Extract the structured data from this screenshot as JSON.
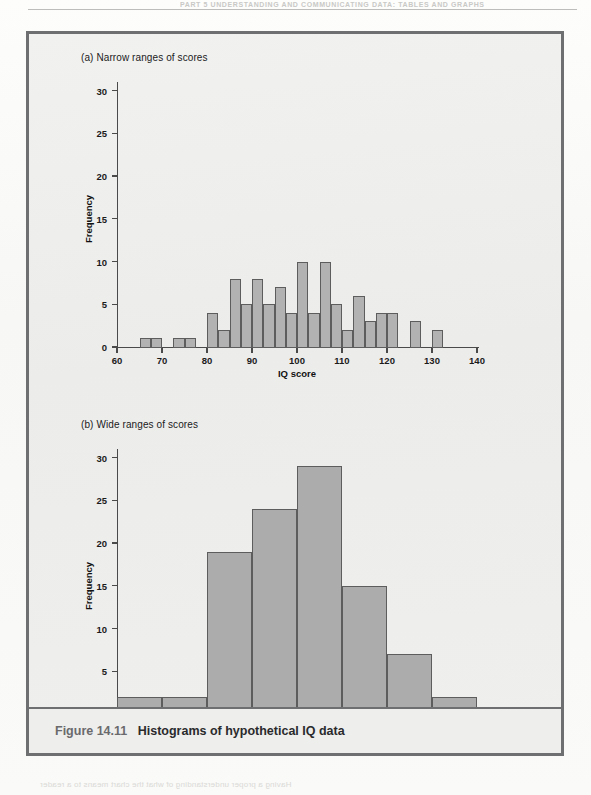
{
  "page": {
    "running_head": "PART 5  UNDERSTANDING AND COMMUNICATING DATA: TABLES AND GRAPHS",
    "ghost_texts": [
      {
        "text": "Figure 14.12  The weary physician: an illustrated tale",
        "x": 150,
        "y": 368,
        "size": 8.5
      },
      {
        "text": "Figure 14.13  Comparison of histogram and bar chart",
        "x": 140,
        "y": 588,
        "size": 8.5
      },
      {
        "text": "the value but does not appear in the category axis because no space",
        "x": 60,
        "y": 650,
        "size": 8
      },
      {
        "text": "the bars and the relative size of a comparison, are still kept in the",
        "x": 60,
        "y": 663,
        "size": 8
      },
      {
        "text": "which data are drawn. A histogram is a plot of a frequency dist",
        "x": 60,
        "y": 676,
        "size": 8
      },
      {
        "text": "Barplots",
        "x": 420,
        "y": 712,
        "size": 11
      },
      {
        "text": "Having a proper understanding of what the chart means to a reader",
        "x": 40,
        "y": 780,
        "size": 8
      }
    ]
  },
  "figure": {
    "caption_label": "Figure 14.11",
    "caption_title": "Histograms of hypothetical IQ data"
  },
  "panels": [
    {
      "id": "panel-a",
      "title": "(a) Narrow ranges of scores"
    },
    {
      "id": "panel-b",
      "title": "(b) Wide ranges of scores"
    }
  ],
  "chart_data": [
    {
      "type": "bar",
      "id": "histogram-narrow",
      "title": "(a) Narrow ranges of scores",
      "xlabel": "IQ score",
      "ylabel": "Frequency",
      "xlim": [
        60,
        140
      ],
      "ylim": [
        0,
        31
      ],
      "xticks": [
        60,
        70,
        80,
        90,
        100,
        110,
        120,
        130,
        140
      ],
      "yticks": [
        0,
        5,
        10,
        15,
        20,
        25,
        30
      ],
      "grid": false,
      "legend": "none",
      "bin_width": 2.5,
      "bars": [
        {
          "x0": 65,
          "x1": 67.5,
          "value": 1
        },
        {
          "x0": 67.5,
          "x1": 70,
          "value": 1
        },
        {
          "x0": 72.5,
          "x1": 75,
          "value": 1
        },
        {
          "x0": 75,
          "x1": 77.5,
          "value": 1
        },
        {
          "x0": 80,
          "x1": 82.5,
          "value": 4
        },
        {
          "x0": 82.5,
          "x1": 85,
          "value": 2
        },
        {
          "x0": 85,
          "x1": 87.5,
          "value": 8
        },
        {
          "x0": 87.5,
          "x1": 90,
          "value": 5
        },
        {
          "x0": 90,
          "x1": 92.5,
          "value": 8
        },
        {
          "x0": 92.5,
          "x1": 95,
          "value": 5
        },
        {
          "x0": 95,
          "x1": 97.5,
          "value": 7
        },
        {
          "x0": 97.5,
          "x1": 100,
          "value": 4
        },
        {
          "x0": 100,
          "x1": 102.5,
          "value": 10
        },
        {
          "x0": 102.5,
          "x1": 105,
          "value": 4
        },
        {
          "x0": 105,
          "x1": 107.5,
          "value": 10
        },
        {
          "x0": 107.5,
          "x1": 110,
          "value": 5
        },
        {
          "x0": 110,
          "x1": 112.5,
          "value": 2
        },
        {
          "x0": 112.5,
          "x1": 115,
          "value": 6
        },
        {
          "x0": 115,
          "x1": 117.5,
          "value": 3
        },
        {
          "x0": 117.5,
          "x1": 120,
          "value": 4
        },
        {
          "x0": 120,
          "x1": 122.5,
          "value": 4
        },
        {
          "x0": 125,
          "x1": 127.5,
          "value": 3
        },
        {
          "x0": 130,
          "x1": 132.5,
          "value": 2
        }
      ]
    },
    {
      "type": "bar",
      "id": "histogram-wide",
      "title": "(b) Wide ranges of scores",
      "xlabel": "IQ score",
      "ylabel": "Frequency",
      "xlim": [
        60,
        140
      ],
      "ylim": [
        0,
        31
      ],
      "xticks": [
        60,
        70,
        80,
        90,
        100,
        110,
        120,
        130,
        140
      ],
      "yticks": [
        0,
        5,
        10,
        15,
        20,
        25,
        30
      ],
      "grid": false,
      "legend": "none",
      "bin_width": 10,
      "bars": [
        {
          "x0": 60,
          "x1": 70,
          "value": 2
        },
        {
          "x0": 70,
          "x1": 80,
          "value": 2
        },
        {
          "x0": 80,
          "x1": 90,
          "value": 19
        },
        {
          "x0": 90,
          "x1": 100,
          "value": 24
        },
        {
          "x0": 100,
          "x1": 110,
          "value": 29
        },
        {
          "x0": 110,
          "x1": 120,
          "value": 15
        },
        {
          "x0": 120,
          "x1": 130,
          "value": 7
        },
        {
          "x0": 130,
          "x1": 140,
          "value": 2
        }
      ]
    }
  ],
  "colors": {
    "bar_fill": "#b2b2b2",
    "bar_stroke": "#5d5d5d",
    "frame": "#6d6f71",
    "panel_bg": "#efefee",
    "axis": "#4a4a4a"
  }
}
